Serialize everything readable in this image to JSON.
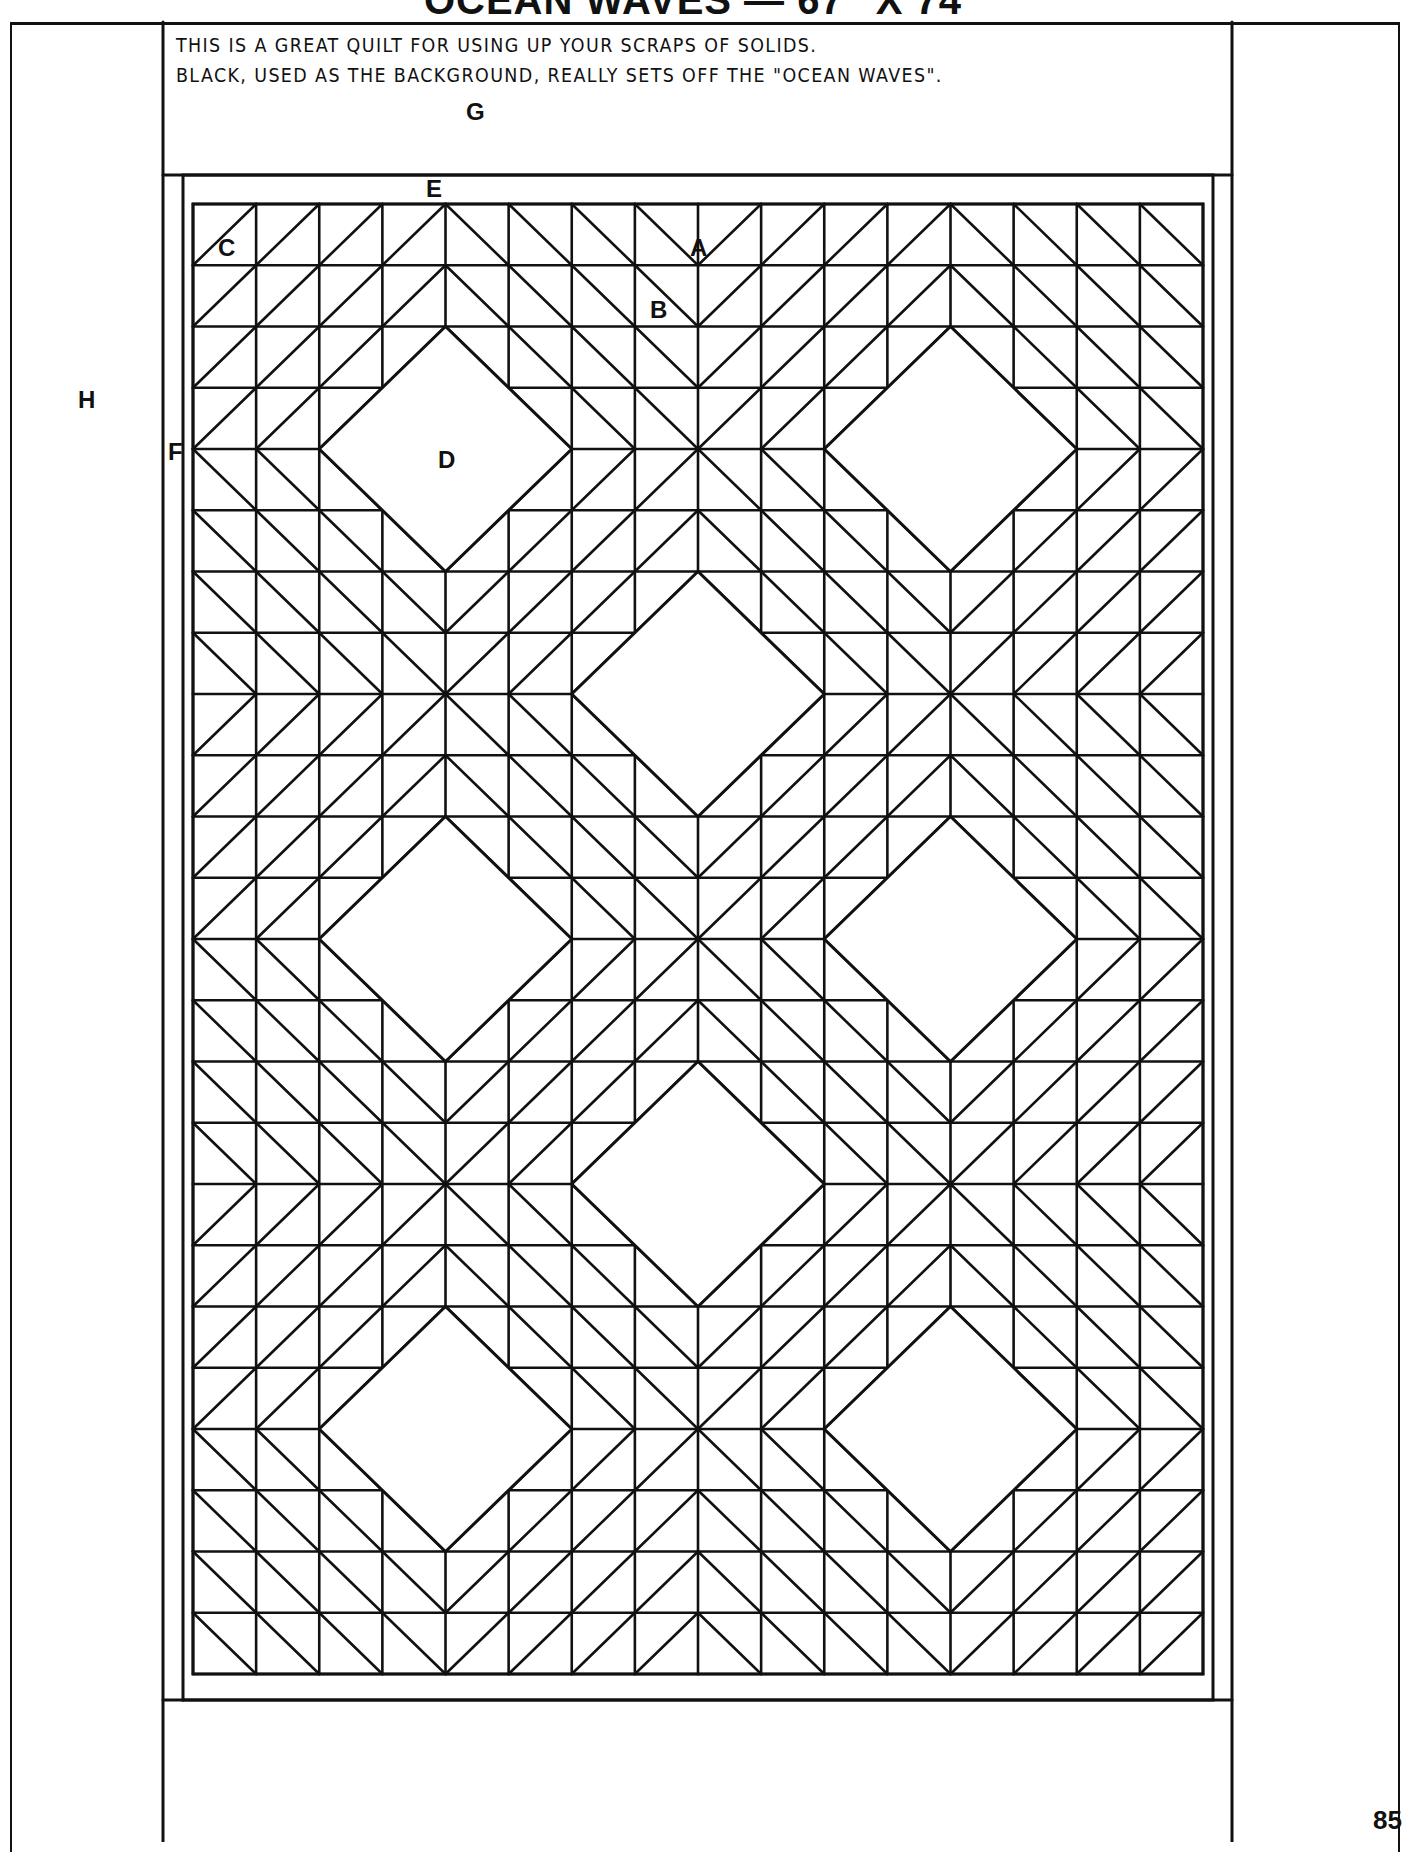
{
  "page": {
    "title": "OCEAN WAVES — 67\" X 74\"",
    "description_lines": [
      "THIS IS A GREAT QUILT FOR USING UP YOUR SCRAPS OF SOLIDS.",
      "BLACK, USED AS THE BACKGROUND, REALLY SETS OFF THE \"OCEAN WAVES\"."
    ],
    "page_number": "85"
  },
  "diagram": {
    "piece_labels": {
      "A": "A",
      "B": "B",
      "C": "C",
      "D": "D",
      "E": "E",
      "F": "F",
      "G": "G",
      "H": "H"
    },
    "quilt_layout": {
      "grid_columns": 16,
      "grid_rows": 24,
      "large_diamonds": 8,
      "line_color": "#111111",
      "background_color": "#ffffff"
    }
  }
}
